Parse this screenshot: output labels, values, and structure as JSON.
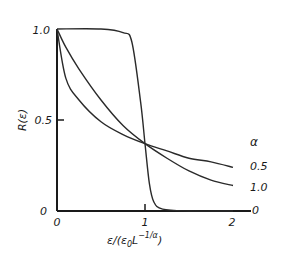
{
  "chart_data": {
    "type": "line",
    "title": "",
    "xlabel": "ε/(ε₀L^(−1/α))",
    "ylabel": "R(ε)",
    "xlim": [
      0,
      2.1
    ],
    "ylim": [
      0,
      1.0
    ],
    "x_ticks": [
      "0",
      "1",
      "2"
    ],
    "y_ticks": [
      "0",
      "0.5",
      "1.0"
    ],
    "legend_title": "α",
    "grid": false,
    "series": [
      {
        "name": "0.5",
        "x": [
          0,
          0.1,
          0.25,
          0.5,
          0.75,
          1.0,
          1.25,
          1.5,
          1.75,
          2.0
        ],
        "values": [
          1.0,
          0.73,
          0.61,
          0.49,
          0.42,
          0.37,
          0.33,
          0.29,
          0.27,
          0.24
        ]
      },
      {
        "name": "1.0",
        "x": [
          0,
          0.1,
          0.25,
          0.5,
          0.75,
          1.0,
          1.25,
          1.5,
          1.75,
          2.0
        ],
        "values": [
          1.0,
          0.9,
          0.78,
          0.61,
          0.47,
          0.37,
          0.29,
          0.22,
          0.17,
          0.14
        ]
      },
      {
        "name": "0",
        "x": [
          0,
          0.5,
          0.75,
          0.85,
          0.95,
          1.0,
          1.05,
          1.1,
          1.2,
          1.5,
          2.0
        ],
        "values": [
          1.0,
          1.0,
          0.98,
          0.93,
          0.6,
          0.37,
          0.15,
          0.05,
          0.01,
          0.0,
          0.0
        ]
      }
    ]
  },
  "labels": {
    "y_axis": "R(ε)",
    "x_axis_main": "ε/(ε",
    "x_axis_sub": "0",
    "x_axis_L": "L",
    "x_axis_sup": "−1/α",
    "x_axis_close": ")",
    "y_tick_0": "0",
    "y_tick_05": "0.5",
    "y_tick_1": "1.0",
    "x_tick_0": "0",
    "x_tick_1": "1",
    "x_tick_2": "2",
    "legend_title": "α",
    "legend_05": "0.5",
    "legend_10": "1.0",
    "legend_0": "0"
  }
}
